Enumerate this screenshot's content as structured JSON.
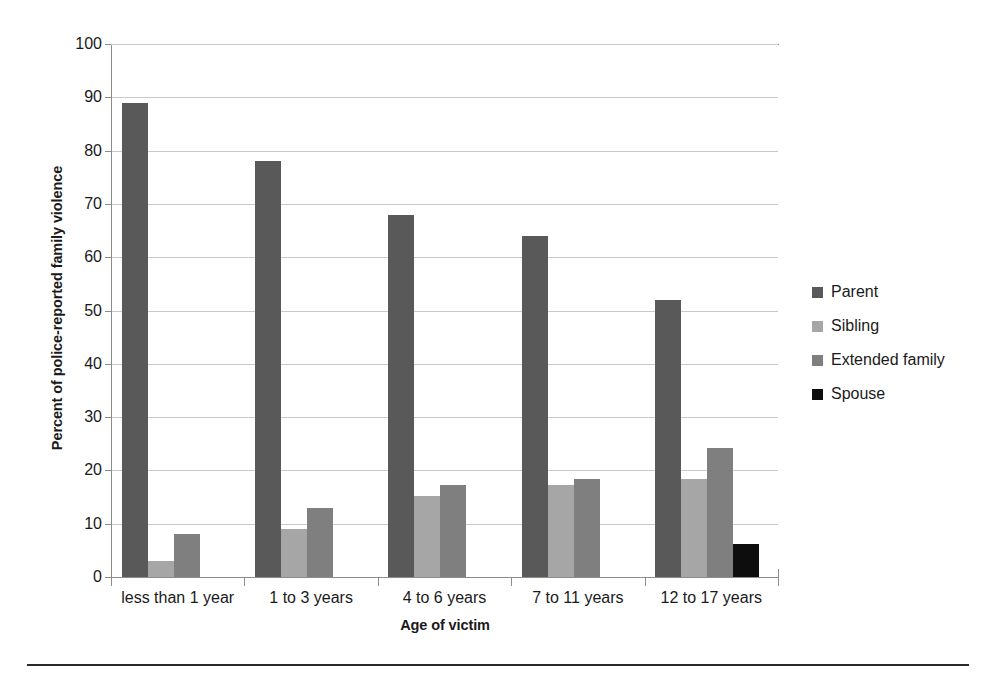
{
  "chart_data": {
    "type": "bar",
    "title": "",
    "xlabel": "Age of victim",
    "ylabel": "Percent of police-reported family violence",
    "categories": [
      "less than 1 year",
      "1 to 3 years",
      "4 to 6 years",
      "7 to 11 years",
      "12 to 17 years"
    ],
    "series": [
      {
        "name": "Parent",
        "color": "#595959",
        "values": [
          89,
          78,
          68,
          64,
          52
        ]
      },
      {
        "name": "Sibling",
        "color": "#a6a6a6",
        "values": [
          3,
          9,
          15.2,
          17.2,
          18.3
        ]
      },
      {
        "name": "Extended family",
        "color": "#7f7f7f",
        "values": [
          8,
          13,
          17.2,
          18.4,
          24.2
        ]
      },
      {
        "name": "Spouse",
        "color": "#0d0d0d",
        "values": [
          0,
          0,
          0,
          0,
          6.2
        ]
      }
    ],
    "ylim": [
      0,
      100
    ],
    "ytick_labels": [
      "100",
      "90",
      "80",
      "70",
      "60",
      "50",
      "40",
      "30",
      "20",
      "10",
      "0"
    ],
    "ytick_values": [
      100,
      90,
      80,
      70,
      60,
      50,
      40,
      30,
      20,
      10,
      0
    ],
    "grid": true,
    "legend_position": "right"
  },
  "legend": {
    "items": [
      {
        "label": "Parent",
        "color": "#595959"
      },
      {
        "label": "Sibling",
        "color": "#a6a6a6"
      },
      {
        "label": "Extended family",
        "color": "#7f7f7f"
      },
      {
        "label": "Spouse",
        "color": "#0d0d0d"
      }
    ]
  }
}
